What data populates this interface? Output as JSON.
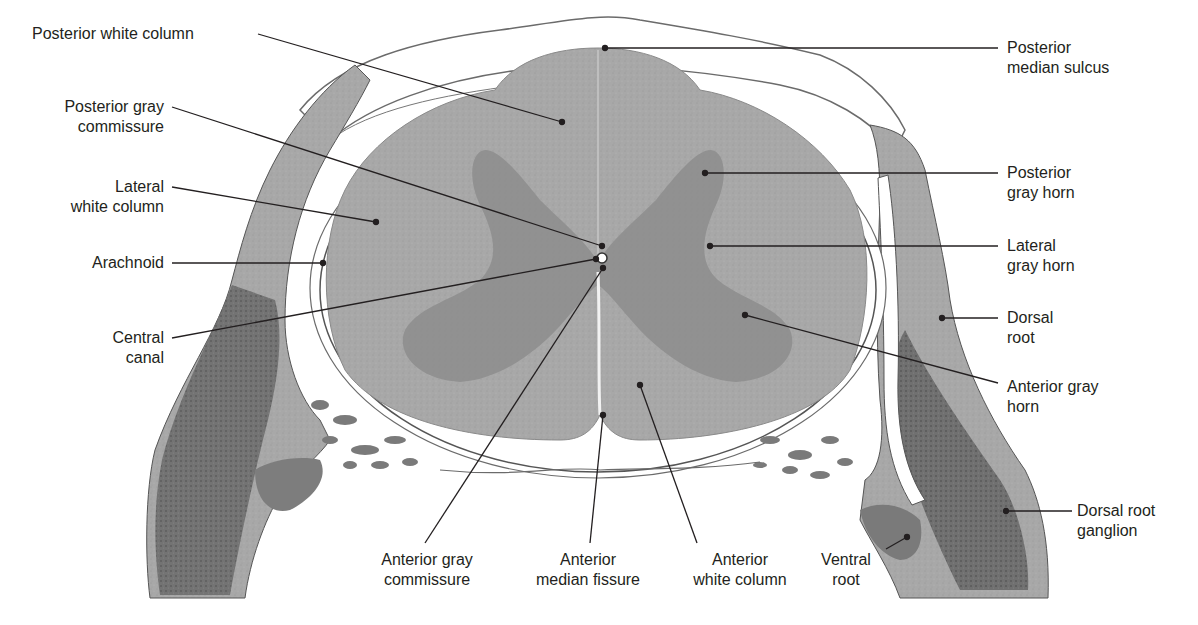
{
  "figure": {
    "colors": {
      "background": "#ffffff",
      "white_matter": "#a7a7a7",
      "gray_matter": "#8c8c8c",
      "meninges_dark": "#6e6e6e",
      "ganglion_dark": "#555555",
      "leader_line": "#231f20",
      "text": "#231f20"
    }
  },
  "labels": {
    "left": [
      {
        "id": "posterior-white-column",
        "lines": [
          "Posterior white column"
        ]
      },
      {
        "id": "posterior-gray-commissure",
        "lines": [
          "Posterior gray",
          "commissure"
        ]
      },
      {
        "id": "lateral-white-column",
        "lines": [
          "Lateral",
          "white column"
        ]
      },
      {
        "id": "arachnoid",
        "lines": [
          "Arachnoid"
        ]
      },
      {
        "id": "central-canal",
        "lines": [
          "Central",
          "canal"
        ]
      }
    ],
    "right": [
      {
        "id": "posterior-median-sulcus",
        "lines": [
          "Posterior",
          "median sulcus"
        ]
      },
      {
        "id": "posterior-gray-horn",
        "lines": [
          "Posterior",
          "gray horn"
        ]
      },
      {
        "id": "lateral-gray-horn",
        "lines": [
          "Lateral",
          "gray horn"
        ]
      },
      {
        "id": "dorsal-root",
        "lines": [
          "Dorsal",
          "root"
        ]
      },
      {
        "id": "anterior-gray-horn",
        "lines": [
          "Anterior gray",
          "horn"
        ]
      },
      {
        "id": "dorsal-root-ganglion",
        "lines": [
          "Dorsal root",
          "ganglion"
        ]
      }
    ],
    "bottom": [
      {
        "id": "anterior-gray-commissure",
        "lines": [
          "Anterior gray",
          "commissure"
        ]
      },
      {
        "id": "anterior-median-fissure",
        "lines": [
          "Anterior",
          "median fissure"
        ]
      },
      {
        "id": "anterior-white-column",
        "lines": [
          "Anterior",
          "white column"
        ]
      },
      {
        "id": "ventral-root",
        "lines": [
          "Ventral",
          "root"
        ]
      }
    ]
  }
}
